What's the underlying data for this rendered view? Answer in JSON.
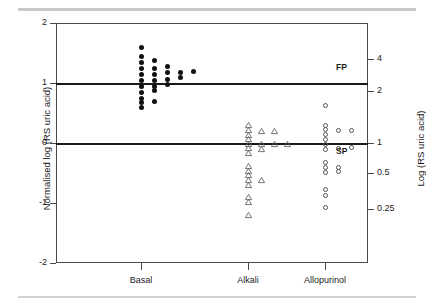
{
  "figure": {
    "background": "#ffffff",
    "frame_color": "#4a4a4a",
    "reference_line_color": "#1a1a1a"
  },
  "axes": {
    "left_title": "Normalised log (RS uric acid)",
    "right_title": "Log (RS uric acid)",
    "left_ticks": [
      "2",
      "1",
      "0",
      "-1",
      "-2"
    ],
    "right_ticks": [
      "4",
      "2",
      "1",
      "0.5",
      "0.25"
    ],
    "x_categories": [
      "Basal",
      "Alkali",
      "Allopurinol"
    ]
  },
  "band_labels": {
    "fp": "FP",
    "sp": "SP"
  },
  "chart_data": {
    "type": "scatter",
    "title": "",
    "xlabel": "",
    "ylabel": "Normalised log (RS uric acid)",
    "y2label": "Log (RS uric acid)",
    "ylim": [
      -2,
      2
    ],
    "yticks": [
      2,
      1,
      0,
      -1,
      -2
    ],
    "y2ticks": [
      4,
      2,
      1,
      0.5,
      0.25
    ],
    "y2tick_positions": [
      1.4,
      0.87,
      0.0,
      -0.5,
      -1.1
    ],
    "grid": false,
    "legend": "none",
    "categories": [
      "Basal",
      "Alkali",
      "Allopurinol"
    ],
    "reference_lines": [
      {
        "y": 1,
        "label": "FP"
      },
      {
        "y": 0,
        "label": "SP"
      }
    ],
    "series": [
      {
        "name": "Basal",
        "marker": "filled-circle",
        "color": "#111111",
        "category_index": 0,
        "points": [
          {
            "offset": 0,
            "y": 1.6
          },
          {
            "offset": 0,
            "y": 1.45
          },
          {
            "offset": 0,
            "y": 1.35
          },
          {
            "offset": 0,
            "y": 1.25
          },
          {
            "offset": 0,
            "y": 1.15
          },
          {
            "offset": 0,
            "y": 1.05
          },
          {
            "offset": 0,
            "y": 0.95
          },
          {
            "offset": 0,
            "y": 0.85
          },
          {
            "offset": 0,
            "y": 0.75
          },
          {
            "offset": 0,
            "y": 0.68
          },
          {
            "offset": 0,
            "y": 0.6
          },
          {
            "offset": 1,
            "y": 1.37
          },
          {
            "offset": 1,
            "y": 1.25
          },
          {
            "offset": 1,
            "y": 1.15
          },
          {
            "offset": 1,
            "y": 1.05
          },
          {
            "offset": 1,
            "y": 0.95
          },
          {
            "offset": 1,
            "y": 0.88
          },
          {
            "offset": 1,
            "y": 0.7
          },
          {
            "offset": 2,
            "y": 1.28
          },
          {
            "offset": 2,
            "y": 1.17
          },
          {
            "offset": 2,
            "y": 1.06
          },
          {
            "offset": 2,
            "y": 0.98
          },
          {
            "offset": 3,
            "y": 1.18
          },
          {
            "offset": 3,
            "y": 1.09
          },
          {
            "offset": 4,
            "y": 1.19
          }
        ]
      },
      {
        "name": "Alkali",
        "marker": "open-triangle",
        "color": "#666666",
        "category_index": 1,
        "points": [
          {
            "offset": 0,
            "y": 0.3
          },
          {
            "offset": 0,
            "y": 0.22
          },
          {
            "offset": 0,
            "y": 0.14
          },
          {
            "offset": 0,
            "y": 0.06
          },
          {
            "offset": 0,
            "y": -0.01
          },
          {
            "offset": 0,
            "y": -0.09
          },
          {
            "offset": 0,
            "y": -0.17
          },
          {
            "offset": 0,
            "y": -0.38
          },
          {
            "offset": 0,
            "y": -0.46
          },
          {
            "offset": 0,
            "y": -0.54
          },
          {
            "offset": 0,
            "y": -0.62
          },
          {
            "offset": 0,
            "y": -0.7
          },
          {
            "offset": 0,
            "y": -0.9
          },
          {
            "offset": 0,
            "y": -0.98
          },
          {
            "offset": 0,
            "y": -1.2
          },
          {
            "offset": 1,
            "y": 0.2
          },
          {
            "offset": 1,
            "y": -0.02
          },
          {
            "offset": 1,
            "y": -0.1
          },
          {
            "offset": 1,
            "y": -0.61
          },
          {
            "offset": 2,
            "y": 0.2
          },
          {
            "offset": 2,
            "y": -0.01
          },
          {
            "offset": 3,
            "y": -0.01
          }
        ]
      },
      {
        "name": "Allopurinol",
        "marker": "open-circle",
        "color": "#555555",
        "category_index": 2,
        "points": [
          {
            "offset": 0,
            "y": 0.62
          },
          {
            "offset": 0,
            "y": 0.3
          },
          {
            "offset": 0,
            "y": 0.22
          },
          {
            "offset": 0,
            "y": 0.14
          },
          {
            "offset": 0,
            "y": 0.06
          },
          {
            "offset": 0,
            "y": -0.02
          },
          {
            "offset": 0,
            "y": -0.1
          },
          {
            "offset": 0,
            "y": -0.33
          },
          {
            "offset": 0,
            "y": -0.41
          },
          {
            "offset": 0,
            "y": -0.49
          },
          {
            "offset": 0,
            "y": -0.78
          },
          {
            "offset": 0,
            "y": -0.88
          },
          {
            "offset": 0,
            "y": -1.08
          },
          {
            "offset": 1,
            "y": 0.21
          },
          {
            "offset": 1,
            "y": -0.09
          },
          {
            "offset": 1,
            "y": -0.4
          },
          {
            "offset": 1,
            "y": -0.48
          },
          {
            "offset": 2,
            "y": 0.21
          },
          {
            "offset": 2,
            "y": -0.08
          }
        ]
      }
    ]
  }
}
